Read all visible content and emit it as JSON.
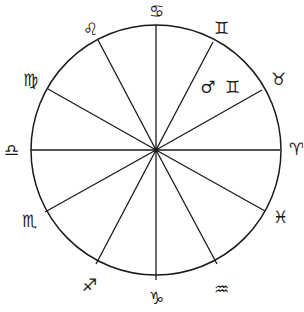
{
  "diagram": {
    "type": "zodiac-wheel",
    "stroke_color": "#1a1a1a",
    "background": "#ffffff",
    "center": [
      156,
      150
    ],
    "radius": 125,
    "divisions": 12,
    "sign_labels": [
      {
        "name": "cancer",
        "glyph": "♋",
        "x": 156,
        "y": 11
      },
      {
        "name": "gemini",
        "glyph": "♊",
        "x": 221,
        "y": 28
      },
      {
        "name": "taurus",
        "glyph": "♉",
        "x": 278,
        "y": 79
      },
      {
        "name": "aries",
        "glyph": "♈",
        "x": 296,
        "y": 149
      },
      {
        "name": "pisces",
        "glyph": "♓",
        "x": 280,
        "y": 217
      },
      {
        "name": "aquarius",
        "glyph": "♒",
        "x": 221,
        "y": 289
      },
      {
        "name": "capricorn",
        "glyph": "♑",
        "x": 156,
        "y": 298
      },
      {
        "name": "sagittarius",
        "glyph": "♐",
        "x": 89,
        "y": 285
      },
      {
        "name": "scorpio",
        "glyph": "♏",
        "x": 29,
        "y": 221
      },
      {
        "name": "libra",
        "glyph": "♎",
        "x": 11,
        "y": 150
      },
      {
        "name": "virgo",
        "glyph": "♍",
        "x": 30,
        "y": 80
      },
      {
        "name": "leo",
        "glyph": "♌",
        "x": 90,
        "y": 29
      }
    ],
    "spokes": [
      {
        "x": 156,
        "y": 25
      },
      {
        "x": 213,
        "y": 42
      },
      {
        "x": 262,
        "y": 90
      },
      {
        "x": 280,
        "y": 150
      },
      {
        "x": 265,
        "y": 211
      },
      {
        "x": 217,
        "y": 264
      },
      {
        "x": 156,
        "y": 280
      },
      {
        "x": 96,
        "y": 264
      },
      {
        "x": 45,
        "y": 212
      },
      {
        "x": 31,
        "y": 150
      },
      {
        "x": 48,
        "y": 89
      },
      {
        "x": 98,
        "y": 40
      }
    ],
    "placements": [
      {
        "planet": "mars",
        "planet_glyph": "♂",
        "sign": "gemini",
        "sign_glyph": "♊",
        "text": "♂ ♊",
        "x": 221,
        "y": 87
      }
    ]
  }
}
